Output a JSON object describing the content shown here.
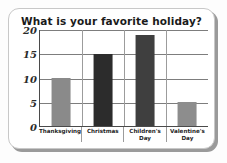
{
  "chart_data": {
    "type": "bar",
    "title": "What is your favorite holiday?",
    "xlabel": "",
    "ylabel": "",
    "categories": [
      "Thanksgiving",
      "Christmas",
      "Children's\nDay",
      "Valentine's\nDay"
    ],
    "values": [
      10,
      15,
      19,
      5
    ],
    "ylim": [
      0,
      20
    ],
    "yticks": [
      "0",
      "5",
      "10",
      "15",
      "20"
    ],
    "ytick_values": [
      0,
      5,
      10,
      15,
      20
    ],
    "grid": true,
    "legend": false,
    "bar_colors": [
      "#8a8a8a",
      "#2c2c2c",
      "#3f3f3f",
      "#8d8d8d"
    ]
  },
  "card": {
    "background": "#ffffff",
    "border_color": "#c8c8c8",
    "shadow_color": "#9a9a9a"
  },
  "axis": {
    "line_color": "#4a4a4a",
    "gridline_color": "#7d7d7d",
    "divider_color": "#9c9c9c"
  }
}
